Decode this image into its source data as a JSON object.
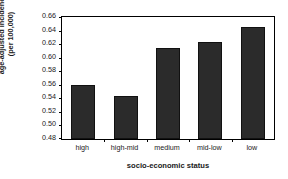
{
  "chart_data": {
    "type": "bar",
    "title": "",
    "subtitle": "",
    "xlabel": "socio-economic status",
    "ylabel": "age-adjusted incidence (per 100,000)",
    "ylabel_lines": [
      "age-adjusted incidence",
      "(per 100,000)"
    ],
    "categories": [
      "high",
      "high-mid",
      "medium",
      "mid-low",
      "low"
    ],
    "values": [
      0.559,
      0.543,
      0.614,
      0.623,
      0.645
    ],
    "ylim": [
      0.48,
      0.66
    ],
    "ytick_labels": [
      "0.48",
      "0.50",
      "0.52",
      "0.54",
      "0.56",
      "0.58",
      "0.60",
      "0.62",
      "0.64",
      "0.66"
    ],
    "ytick_values": [
      0.48,
      0.5,
      0.52,
      0.54,
      0.56,
      0.58,
      0.6,
      0.62,
      0.64,
      0.66
    ],
    "grid": false,
    "legend": false,
    "legend_position": "none",
    "bar_color": "#2b2b2b",
    "frame_color": "#000000",
    "background_color": "#ffffff"
  }
}
